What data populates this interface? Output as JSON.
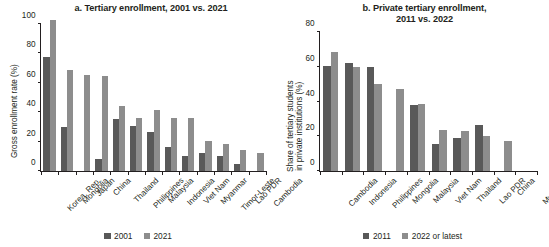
{
  "figure": {
    "background": "#ffffff",
    "series_colors": {
      "dark": "#595959",
      "light": "#8d8d8d"
    }
  },
  "panel_a": {
    "title": "a. Tertiary enrollment, 2001 vs. 2021",
    "ylabel": "Gross enrollment rate (%)",
    "legend": [
      {
        "label": "2001",
        "color": "#595959"
      },
      {
        "label": "2021",
        "color": "#8d8d8d"
      }
    ]
  },
  "panel_b": {
    "title_line1": "b. Private tertiary enrollment,",
    "title_line2": "2011 vs. 2022",
    "ylabel_line1": "Share of tertiary students",
    "ylabel_line2": "in private institutions (%)",
    "legend": [
      {
        "label": "2011",
        "color": "#595959"
      },
      {
        "label": "2022 or latest",
        "color": "#8d8d8d"
      }
    ]
  },
  "chart_data": [
    {
      "type": "bar",
      "id": "panel-a",
      "title": "a. Tertiary enrollment, 2001 vs. 2021",
      "xlabel": "",
      "ylabel": "Gross enrollment rate (%)",
      "ylim": [
        0,
        100
      ],
      "yticks": [
        0,
        20,
        40,
        60,
        80,
        100
      ],
      "grid": false,
      "legend_position": "bottom-center",
      "categories": [
        "Korea, Rep.",
        "Mongolia",
        "Japan",
        "China",
        "Thailand",
        "Philippines",
        "Malaysia",
        "Indonesia",
        "Viet Nam",
        "Myanmar",
        "Timor-Leste",
        "Lao PDR",
        "Cambodia"
      ],
      "series": [
        {
          "name": "2001",
          "color": "#595959",
          "values": [
            77,
            30,
            null,
            8,
            35,
            30.5,
            26.5,
            16,
            10,
            12,
            10,
            4.5,
            null
          ]
        },
        {
          "name": "2021",
          "color": "#8d8d8d",
          "values": [
            102,
            68,
            65,
            64.5,
            44,
            36,
            41.5,
            36,
            35.5,
            20,
            18,
            14,
            12
          ]
        }
      ]
    },
    {
      "type": "bar",
      "id": "panel-b",
      "title": "b. Private tertiary enrollment, 2011 vs. 2022",
      "xlabel": "",
      "ylabel": "Share of tertiary students in private institutions (%)",
      "ylim": [
        0,
        80
      ],
      "yticks": [
        0,
        20,
        40,
        60,
        80
      ],
      "grid": false,
      "legend_position": "bottom-center",
      "categories": [
        "Cambodia",
        "Indonesia",
        "Philippines",
        "Mongolia",
        "Malaysia",
        "Viet Nam",
        "Thailand",
        "Lao PDR",
        "China",
        "Myanmar"
      ],
      "series": [
        {
          "name": "2011",
          "color": "#595959",
          "values": [
            60,
            61.5,
            59.5,
            null,
            37.5,
            15.5,
            19,
            26.5,
            null,
            null
          ]
        },
        {
          "name": "2022 or latest",
          "color": "#8d8d8d",
          "values": [
            68,
            59.5,
            50,
            47,
            38.5,
            23.5,
            23,
            20,
            17,
            null
          ]
        }
      ]
    }
  ]
}
